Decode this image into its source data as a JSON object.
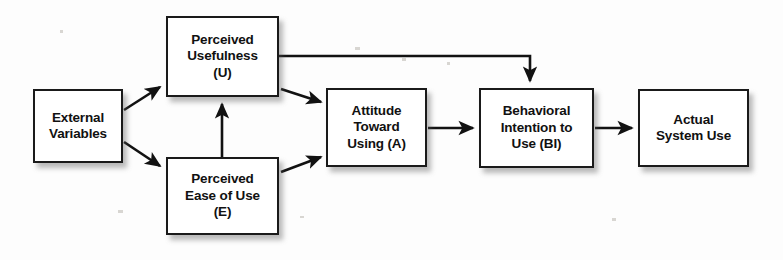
{
  "diagram": {
    "type": "flow-diagram",
    "background_color": "#fdfdfd",
    "box_border_color": "#1a1a1a",
    "box_fill_color": "#ffffff",
    "arrow_color": "#121212",
    "nodes": [
      {
        "id": "external",
        "label": "External\nVariables",
        "x": 33,
        "y": 89,
        "w": 90,
        "h": 74
      },
      {
        "id": "usefulness",
        "label": "Perceived\nUsefulness\n(U)",
        "x": 166,
        "y": 16,
        "w": 113,
        "h": 81
      },
      {
        "id": "ease",
        "label": "Perceived\nEase of Use\n(E)",
        "x": 166,
        "y": 157,
        "w": 113,
        "h": 78
      },
      {
        "id": "attitude",
        "label": "Attitude\nToward\nUsing (A)",
        "x": 326,
        "y": 88,
        "w": 101,
        "h": 79
      },
      {
        "id": "intention",
        "label": "Behavioral\nIntention to\nUse (BI)",
        "x": 479,
        "y": 88,
        "w": 115,
        "h": 80
      },
      {
        "id": "actual",
        "label": "Actual\nSystem Use",
        "x": 638,
        "y": 89,
        "w": 111,
        "h": 78
      }
    ],
    "edges": [
      {
        "id": "external-to-usefulness",
        "from": "external",
        "to": "usefulness",
        "style": "diagonal-up"
      },
      {
        "id": "external-to-ease",
        "from": "external",
        "to": "ease",
        "style": "diagonal-down"
      },
      {
        "id": "ease-to-usefulness",
        "from": "ease",
        "to": "usefulness",
        "style": "vertical-up"
      },
      {
        "id": "usefulness-to-attitude",
        "from": "usefulness",
        "to": "attitude",
        "style": "diagonal-down"
      },
      {
        "id": "ease-to-attitude",
        "from": "ease",
        "to": "attitude",
        "style": "diagonal-up"
      },
      {
        "id": "usefulness-to-intention",
        "from": "usefulness",
        "to": "intention",
        "style": "orthogonal-over-top"
      },
      {
        "id": "attitude-to-intention",
        "from": "attitude",
        "to": "intention",
        "style": "horizontal"
      },
      {
        "id": "intention-to-actual",
        "from": "intention",
        "to": "actual",
        "style": "horizontal"
      }
    ]
  }
}
